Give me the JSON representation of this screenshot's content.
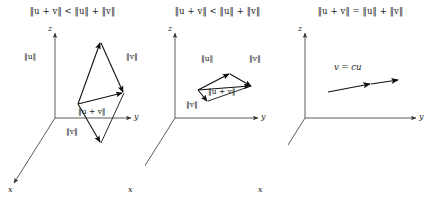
{
  "figure": {
    "axis_color": "#4a4a4a",
    "vector_color": "#1a1a1a",
    "background": "#ffffff"
  },
  "axis_labels": {
    "x": "x",
    "y": "y",
    "z": "z"
  },
  "panels": [
    {
      "id": "panel-strict-inequality-general",
      "formula_parts": {
        "lhs_open": "‖",
        "u": "u",
        "plus": " + ",
        "v": "v",
        "lhs_close": "‖",
        "relation": " < ",
        "rhs": "‖u‖ + ‖v‖"
      },
      "formula": "‖u + v‖ < ‖u‖ + ‖v‖",
      "labels": {
        "u_left": "‖u‖",
        "v_right": "‖v‖",
        "sum": "‖u + v‖",
        "v_bottom": "‖v‖"
      }
    },
    {
      "id": "panel-strict-inequality-flat",
      "formula": "‖u + v‖ < ‖u‖ + ‖v‖",
      "labels": {
        "u_left": "‖u‖",
        "v_right": "‖v‖",
        "sum": "‖u + v‖",
        "v_bottom": "‖v‖"
      }
    },
    {
      "id": "panel-equality-parallel",
      "formula": "‖u + v‖ = ‖u‖ + ‖v‖",
      "labels": {
        "parallel_relation": "v = cu"
      }
    }
  ]
}
